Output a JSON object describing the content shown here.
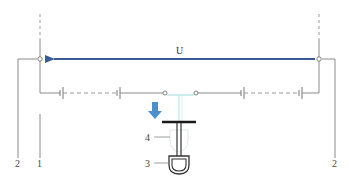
{
  "diagram": {
    "labels": {
      "voltage": "U",
      "left_inner": "1",
      "left_outer": "2",
      "right_outer": "2",
      "handle": "3",
      "rod": "4"
    },
    "colors": {
      "wire": "#8a8a8a",
      "arrow": "#3a5a98",
      "cyan_wire": "#bfe6e8",
      "down_arrow": "#4a90d0",
      "tbar": "#1a1a1a",
      "handle": "#333333"
    }
  }
}
